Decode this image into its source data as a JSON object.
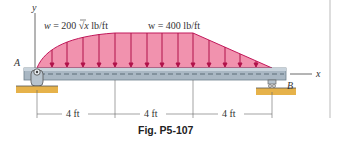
{
  "diagram": {
    "y_axis_label": "y",
    "x_axis_label": "x",
    "support_a_label": "A",
    "support_b_label": "B",
    "load_left_label_prefix": "w = 200",
    "load_left_label_var": "x",
    "load_left_label_unit": "lb/ft",
    "load_right_label": "w = 400 lb/ft",
    "dimensions": [
      "4 ft",
      "4 ft",
      "4 ft"
    ],
    "caption": "Fig. P5-107"
  },
  "colors": {
    "load_fill": "#e8628a",
    "load_edge": "#c2185b",
    "beam": "#aab8c4",
    "beam_edge": "#6e7f8c",
    "ground": "#e6b24a"
  }
}
